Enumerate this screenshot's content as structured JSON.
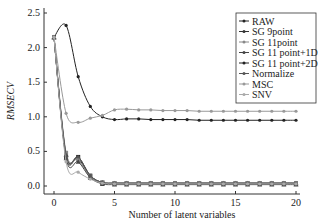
{
  "chart_data": {
    "type": "line",
    "title": "",
    "xlabel": "Number of latent variables",
    "ylabel": "RMSECV",
    "xlim": [
      0,
      20
    ],
    "ylim": [
      0,
      2.5
    ],
    "xticks": [
      0,
      5,
      10,
      15,
      20
    ],
    "yticks": [
      "0.0",
      "0.5",
      "1.0",
      "1.5",
      "2.0",
      "2.5"
    ],
    "grid": false,
    "legend_position": "upper right",
    "x": [
      0,
      1,
      2,
      3,
      4,
      5,
      6,
      7,
      8,
      9,
      10,
      11,
      12,
      13,
      14,
      15,
      16,
      17,
      18,
      19,
      20
    ],
    "series": [
      {
        "name": "RAW",
        "color": "#222222",
        "values": [
          2.15,
          0.42,
          0.42,
          0.15,
          0.05,
          0.04,
          0.04,
          0.04,
          0.04,
          0.04,
          0.04,
          0.04,
          0.04,
          0.04,
          0.04,
          0.04,
          0.04,
          0.04,
          0.04,
          0.04,
          0.04
        ]
      },
      {
        "name": "SG 9point",
        "color": "#333333",
        "values": [
          2.15,
          0.45,
          0.4,
          0.14,
          0.05,
          0.04,
          0.04,
          0.04,
          0.04,
          0.04,
          0.04,
          0.04,
          0.04,
          0.04,
          0.04,
          0.04,
          0.04,
          0.04,
          0.04,
          0.04,
          0.04
        ]
      },
      {
        "name": "SG 11point",
        "color": "#888888",
        "values": [
          2.15,
          0.48,
          0.38,
          0.14,
          0.05,
          0.04,
          0.04,
          0.04,
          0.04,
          0.04,
          0.04,
          0.04,
          0.04,
          0.04,
          0.04,
          0.04,
          0.04,
          0.04,
          0.04,
          0.04,
          0.04
        ]
      },
      {
        "name": "SG 11 point+1D",
        "color": "#444444",
        "values": [
          2.15,
          0.4,
          0.35,
          0.12,
          0.03,
          0.02,
          0.02,
          0.02,
          0.02,
          0.02,
          0.02,
          0.02,
          0.02,
          0.02,
          0.02,
          0.02,
          0.02,
          0.02,
          0.02,
          0.02,
          0.02
        ]
      },
      {
        "name": "SG 11 point+2D",
        "color": "#222222",
        "values": [
          2.15,
          2.32,
          1.58,
          1.15,
          1.0,
          0.96,
          0.97,
          0.97,
          0.96,
          0.96,
          0.96,
          0.96,
          0.95,
          0.95,
          0.95,
          0.95,
          0.95,
          0.95,
          0.95,
          0.95,
          0.95
        ]
      },
      {
        "name": "Normalize",
        "color": "#555555",
        "values": [
          2.15,
          0.45,
          0.42,
          0.15,
          0.05,
          0.04,
          0.04,
          0.04,
          0.04,
          0.04,
          0.04,
          0.04,
          0.04,
          0.04,
          0.04,
          0.04,
          0.04,
          0.04,
          0.04,
          0.04,
          0.04
        ]
      },
      {
        "name": "MSC",
        "color": "#999999",
        "values": [
          2.15,
          1.05,
          0.92,
          0.98,
          1.02,
          1.1,
          1.11,
          1.1,
          1.1,
          1.09,
          1.09,
          1.09,
          1.08,
          1.08,
          1.08,
          1.08,
          1.08,
          1.08,
          1.08,
          1.08,
          1.08
        ]
      },
      {
        "name": "SNV",
        "color": "#aaaaaa",
        "values": [
          2.15,
          0.35,
          0.2,
          0.1,
          0.04,
          0.03,
          0.03,
          0.03,
          0.03,
          0.03,
          0.03,
          0.03,
          0.03,
          0.03,
          0.03,
          0.03,
          0.03,
          0.03,
          0.03,
          0.03,
          0.03
        ]
      }
    ]
  }
}
